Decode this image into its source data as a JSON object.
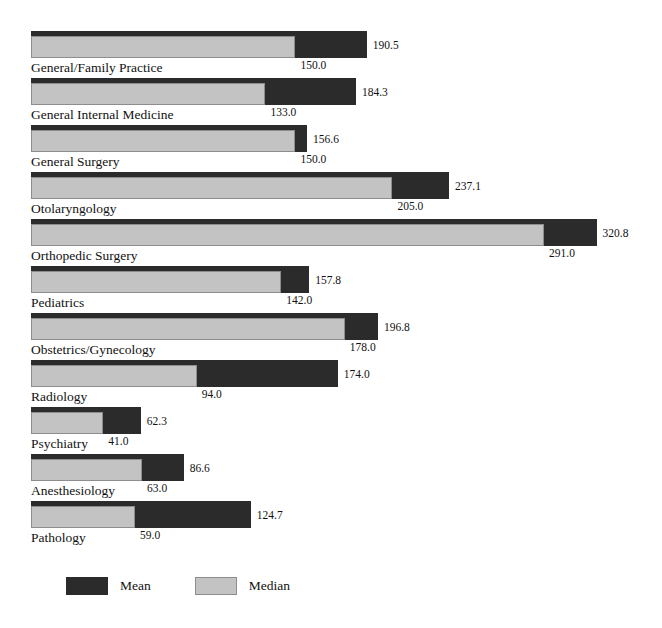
{
  "chart_data": {
    "type": "bar",
    "title": "",
    "subtitle": "",
    "xlabel": "",
    "ylabel": "",
    "orientation": "horizontal",
    "grid": false,
    "legend_position": "bottom-left",
    "xlim": [
      0,
      320.8
    ],
    "categories": [
      "General/Family Practice",
      "General Internal Medicine",
      "General Surgery",
      "Otolaryngology",
      "Orthopedic Surgery",
      "Pediatrics",
      "Obstetrics/Gynecology",
      "Radiology",
      "Psychiatry",
      "Anesthesiology",
      "Pathology"
    ],
    "series": [
      {
        "name": "Mean",
        "color": "#2b2b2b",
        "values": [
          190.5,
          184.3,
          156.6,
          237.1,
          320.8,
          157.8,
          196.8,
          174.0,
          62.3,
          86.6,
          124.7
        ],
        "labels": [
          "190.5",
          "184.3",
          "156.6",
          "237.1",
          "320.8",
          "157.8",
          "196.8",
          "174.0",
          "62.3",
          "86.6",
          "124.7"
        ]
      },
      {
        "name": "Median",
        "color": "#c3c3c3",
        "values": [
          150.0,
          133.0,
          150.0,
          205.0,
          291.0,
          142.0,
          178.0,
          94.0,
          41.0,
          63.0,
          59.0
        ],
        "labels": [
          "150.0",
          "133.0",
          "150.0",
          "205.0",
          "291.0",
          "142.0",
          "178.0",
          "94.0",
          "41.0",
          "63.0",
          "59.0"
        ]
      }
    ]
  },
  "legend": {
    "mean_label": "Mean",
    "median_label": "Median"
  },
  "colors": {
    "mean": "#2b2b2b",
    "median": "#c3c3c3",
    "median_border": "#8d8d8d",
    "background": "#ffffff",
    "text": "#111111"
  }
}
